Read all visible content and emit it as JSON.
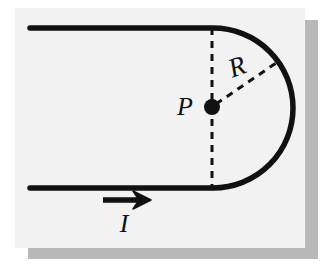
{
  "figure": {
    "kind": "physics-diagram",
    "background_color": "#f2f2f2",
    "page_color": "#ffffff",
    "ink_color": "#111111",
    "shadow_color": "#b8b8b8",
    "panel": {
      "x": 15,
      "y": 8,
      "width": 290,
      "height": 240
    },
    "shadow": {
      "right": {
        "x": 305,
        "y": 20,
        "width": 13,
        "height": 238
      },
      "bottom": {
        "x": 28,
        "y": 248,
        "width": 290,
        "height": 11
      }
    },
    "wire": {
      "label": "hairpin-wire",
      "stroke_width": 5,
      "top_lead": {
        "x1": 30,
        "y1": 28,
        "x2": 213,
        "y2": 28
      },
      "bottom_lead": {
        "x1": 30,
        "y1": 188,
        "x2": 213,
        "y2": 188
      },
      "arc": {
        "center_x": 212,
        "center_y": 108,
        "radius": 80,
        "start_x": 213,
        "start_y": 28,
        "end_x": 213,
        "end_y": 188,
        "sweep": "clockwise-right-half"
      }
    },
    "diameter_line": {
      "label": "dashed-diameter",
      "x": 212,
      "y1": 28,
      "y2": 188,
      "dash": "7,6",
      "stroke_width": 3
    },
    "radius_line": {
      "label": "dashed-radius",
      "x1": 214,
      "y1": 105,
      "x2": 279,
      "y2": 61,
      "dash": "7,6",
      "stroke_width": 3
    },
    "center_point": {
      "label": "center-dot",
      "x": 212,
      "y": 107,
      "radius": 8
    },
    "current_arrow": {
      "label": "current-direction-arrow",
      "x1": 103,
      "y1": 200,
      "x2": 150,
      "y2": 200,
      "stroke_width": 5,
      "head_length": 16,
      "head_half_width": 9
    },
    "labels": {
      "point": {
        "text": "P",
        "x": 185,
        "y": 115,
        "font_size": 26
      },
      "radius": {
        "text": "R",
        "x": 232,
        "y": 75,
        "font_size": 27,
        "rotation": -22
      },
      "current": {
        "text": "I",
        "x": 118,
        "y": 232,
        "font_size": 26
      }
    }
  }
}
